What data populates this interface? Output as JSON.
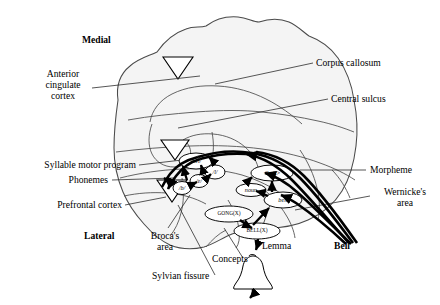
{
  "figure": {
    "background": "#ffffff",
    "line_color": "#3a3a3a",
    "arrow_color": "#000000",
    "width": 440,
    "height": 305
  },
  "orientation_labels": [
    {
      "name": "medial",
      "text": "Medial"
    },
    {
      "name": "lateral",
      "text": "Lateral"
    }
  ],
  "anatomy_labels": [
    {
      "name": "anterior-cingulate-cortex",
      "text": "Anterior\ncingulate\ncortex"
    },
    {
      "name": "corpus-callosum",
      "text": "Corpus callosum"
    },
    {
      "name": "central-sulcus",
      "text": "Central sulcus"
    },
    {
      "name": "syllable-motor-program",
      "text": "Syllable motor program"
    },
    {
      "name": "phonemes",
      "text": "Phonemes"
    },
    {
      "name": "prefrontal-cortex",
      "text": "Prefrontal cortex"
    },
    {
      "name": "brocas-area",
      "text": "Broca's\narea"
    },
    {
      "name": "sylvian-fissure",
      "text": "Sylvian fissure"
    },
    {
      "name": "concepts",
      "text": "Concepts"
    },
    {
      "name": "lemma",
      "text": "Lemma"
    },
    {
      "name": "morpheme",
      "text": "Morpheme"
    },
    {
      "name": "wernickes-area",
      "text": "Wernicke's\narea"
    },
    {
      "name": "bell-output",
      "text": "Bell"
    }
  ],
  "nodes": [
    {
      "name": "node-syllable-bell",
      "label": "/bɛl/",
      "style": "italic"
    },
    {
      "name": "node-phoneme-l",
      "label": "/l/",
      "style": "italic"
    },
    {
      "name": "node-phoneme-e",
      "label": "/ɛ/",
      "style": "italic"
    },
    {
      "name": "node-phoneme-b",
      "label": "/b/",
      "style": "italic"
    },
    {
      "name": "node-morpheme-bell",
      "label": "<bell>",
      "style": "plain"
    },
    {
      "name": "node-noun",
      "label": "noun",
      "style": "italic"
    },
    {
      "name": "node-lemma-bell",
      "label": "bell",
      "style": "italic"
    },
    {
      "name": "node-concept-gong",
      "label": "GONG(X)",
      "style": "plain"
    },
    {
      "name": "node-concept-bell",
      "label": "BELL(X)",
      "style": "plain"
    }
  ],
  "icons": [
    {
      "name": "bell-object-icon",
      "text": ""
    },
    {
      "name": "triangle-marker-icon",
      "text": ""
    }
  ]
}
